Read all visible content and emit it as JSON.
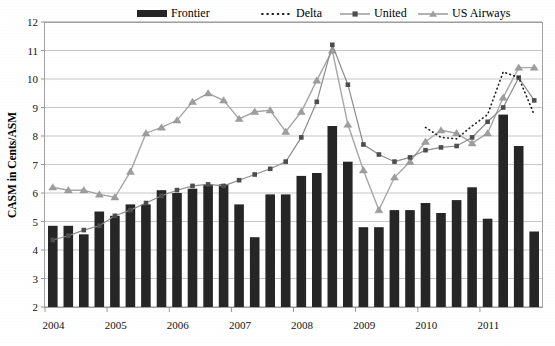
{
  "chart_data": {
    "type": "bar",
    "title": "",
    "subtitle": "",
    "xlabel": "",
    "ylabel": "CASM in Cents/ASM",
    "ylim": [
      2,
      12
    ],
    "y_ticks": [
      2,
      3,
      4,
      5,
      6,
      7,
      8,
      9,
      10,
      11,
      12
    ],
    "y_tick_labels": [
      "2",
      "3",
      "4",
      "5",
      "6",
      "7",
      "8",
      "9",
      "10",
      "11",
      "12"
    ],
    "grid": true,
    "legend_position": "top",
    "x_tick_labels": [
      "2004",
      "2005",
      "2006",
      "2007",
      "2008",
      "2009",
      "2010",
      "2011"
    ],
    "x_categories": [
      "2004 Q1",
      "2004 Q2",
      "2004 Q3",
      "2004 Q4",
      "2005 Q1",
      "2005 Q2",
      "2005 Q3",
      "2005 Q4",
      "2006 Q1",
      "2006 Q2",
      "2006 Q3",
      "2006 Q4",
      "2007 Q1",
      "2007 Q2",
      "2007 Q3",
      "2007 Q4",
      "2008 Q1",
      "2008 Q2",
      "2008 Q3",
      "2008 Q4",
      "2009 Q1",
      "2009 Q2",
      "2009 Q3",
      "2009 Q4",
      "2010 Q1",
      "2010 Q2",
      "2010 Q3",
      "2010 Q4",
      "2011 Q1",
      "2011 Q2",
      "2011 Q3",
      "2011 Q4"
    ],
    "series": [
      {
        "name": "Frontier",
        "render": "bar",
        "color": "#262626",
        "values": [
          4.85,
          4.85,
          4.55,
          5.35,
          5.2,
          5.6,
          5.6,
          6.1,
          6.0,
          6.15,
          6.3,
          6.3,
          5.6,
          4.45,
          5.95,
          5.95,
          6.6,
          6.7,
          8.35,
          7.1,
          4.8,
          4.8,
          5.4,
          5.4,
          5.65,
          5.3,
          5.75,
          6.2,
          5.1,
          8.75,
          7.65,
          4.65
        ]
      },
      {
        "name": "Delta",
        "render": "dotted-line",
        "color": "#1a1a1a",
        "start_index": 24,
        "values": [
          null,
          null,
          null,
          null,
          null,
          null,
          null,
          null,
          null,
          null,
          null,
          null,
          null,
          null,
          null,
          null,
          null,
          null,
          null,
          null,
          null,
          null,
          null,
          null,
          8.3,
          7.95,
          7.9,
          8.35,
          8.75,
          10.25,
          10.05,
          8.75
        ]
      },
      {
        "name": "United",
        "render": "line-square",
        "color": "#8c8c8c",
        "marker": "square",
        "values": [
          4.35,
          4.5,
          4.7,
          4.85,
          5.2,
          5.4,
          5.65,
          5.9,
          6.1,
          6.25,
          6.3,
          6.25,
          6.45,
          6.65,
          6.85,
          7.1,
          7.95,
          9.2,
          11.2,
          9.8,
          7.7,
          7.35,
          7.1,
          7.25,
          7.5,
          7.6,
          7.65,
          7.95,
          8.5,
          9.0,
          10.05,
          9.25
        ]
      },
      {
        "name": "US Airways",
        "render": "line-triangle",
        "color": "#9e9e9e",
        "marker": "triangle",
        "values": [
          6.2,
          6.1,
          6.1,
          5.95,
          5.85,
          6.75,
          8.1,
          8.3,
          8.55,
          9.2,
          9.5,
          9.25,
          8.6,
          8.85,
          8.9,
          8.15,
          8.85,
          9.95,
          11.0,
          8.4,
          6.8,
          5.4,
          6.55,
          7.1,
          7.8,
          8.2,
          8.1,
          7.75,
          8.1,
          9.35,
          10.4,
          10.4
        ]
      }
    ]
  },
  "legend": {
    "items": [
      {
        "label": "Frontier",
        "glyph": "bar-swatch-icon"
      },
      {
        "label": "Delta",
        "glyph": "dotted-line-icon"
      },
      {
        "label": "United",
        "glyph": "line-square-marker-icon"
      },
      {
        "label": "US Airways",
        "glyph": "line-triangle-marker-icon"
      }
    ]
  },
  "axes": {
    "y_title": "CASM in Cents/ASM"
  },
  "colors": {
    "frontier": "#262626",
    "delta": "#1a1a1a",
    "united": "#8c8c8c",
    "us_airways": "#9e9e9e",
    "grid": "#b9b9b9",
    "background": "#ffffff"
  }
}
